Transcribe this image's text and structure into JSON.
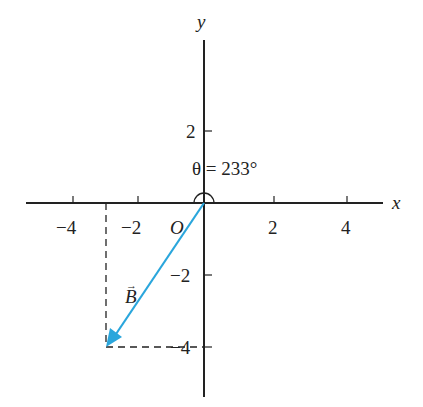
{
  "diagram": {
    "axes": {
      "x_label": "x",
      "y_label": "y",
      "origin_label": "O",
      "x_ticks": [
        {
          "value": -4,
          "label": "−4"
        },
        {
          "value": -2,
          "label": "−2"
        },
        {
          "value": 2,
          "label": "2"
        },
        {
          "value": 4,
          "label": "4"
        }
      ],
      "y_ticks": [
        {
          "value": 2,
          "label": "2"
        },
        {
          "value": -2,
          "label": "−2"
        },
        {
          "value": -4,
          "label": "−4"
        }
      ]
    },
    "vector": {
      "name": "B",
      "label": "B",
      "arrow_symbol": "→",
      "from": [
        0,
        0
      ],
      "to": [
        -3,
        -4
      ],
      "color": "#2aa6dc"
    },
    "angle": {
      "label": "θ = 233°",
      "value_deg": 233
    },
    "projection_lines": {
      "style": "dashed",
      "x_component": -3,
      "y_component": -4
    }
  }
}
